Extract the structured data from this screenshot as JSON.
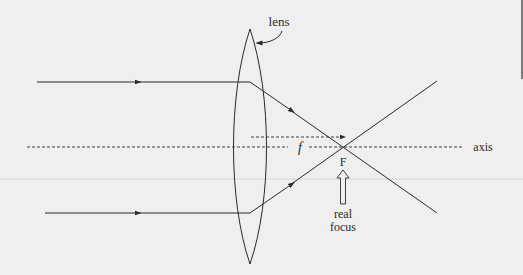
{
  "diagram": {
    "type": "converging-lens-ray-diagram",
    "labels": {
      "lens": "lens",
      "focal_length": "f",
      "focus_point": "F",
      "axis": "axis",
      "real_focus_line1": "real",
      "real_focus_line2": "focus"
    },
    "elements": {
      "lens": {
        "shape": "biconvex",
        "center_x": 250,
        "top_y": 29,
        "bottom_y": 264
      },
      "principal_axis": {
        "y": 147,
        "style": "dashed"
      },
      "incident_rays": [
        {
          "y": 82,
          "direction": "right"
        },
        {
          "y": 213,
          "direction": "right"
        }
      ],
      "focal_point": {
        "x": 343,
        "y": 147
      },
      "focal_length_arrow": {
        "y": 137,
        "style": "dashed",
        "from_x": 251,
        "to_x": 343
      }
    },
    "colors": {
      "background": "#efefef",
      "ink": "#2a2a2a"
    }
  }
}
